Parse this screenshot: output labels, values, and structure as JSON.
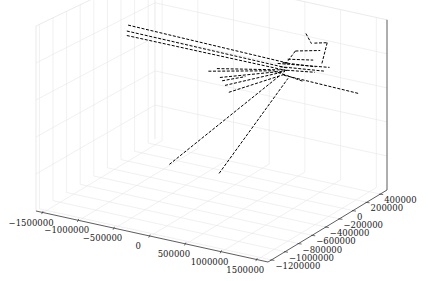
{
  "chart_data": {
    "type": "line3d",
    "title": "",
    "xlabel": "",
    "ylabel": "",
    "zlabel": "",
    "grid": true,
    "line_style": "dashed",
    "line_color": "#000000",
    "pane_color": "#ffffff",
    "grid_color": "#e6e6e6",
    "xlim": [
      -1600000,
      1650000
    ],
    "ylim": [
      -1250000,
      500000
    ],
    "zlim": [
      0,
      1
    ],
    "x_ticks": [
      -1500000,
      -1000000,
      -500000,
      0,
      500000,
      1000000,
      1500000
    ],
    "x_tick_labels": [
      "−1500000",
      "−1000000",
      "−500000",
      "0",
      "500000",
      "1000000",
      "1500000"
    ],
    "y_ticks": [
      -1200000,
      -1000000,
      -800000,
      -600000,
      -400000,
      -200000,
      0,
      200000,
      400000
    ],
    "y_tick_labels": [
      "−1200000",
      "−1000000",
      "−800000",
      "−600000",
      "−400000",
      "−200000",
      "0",
      "200000",
      "400000"
    ],
    "z_ticks": [],
    "series": [
      {
        "name": "path-1",
        "points": [
          [
            -1500000,
            0,
            0.78
          ],
          [
            600000,
            150000,
            0.72
          ]
        ]
      },
      {
        "name": "path-2",
        "points": [
          [
            -1500000,
            -20000,
            0.75
          ],
          [
            620000,
            120000,
            0.7
          ]
        ]
      },
      {
        "name": "path-3",
        "points": [
          [
            -1480000,
            -40000,
            0.73
          ],
          [
            640000,
            100000,
            0.69
          ]
        ]
      },
      {
        "name": "path-4",
        "points": [
          [
            -200000,
            -60000,
            0.66
          ],
          [
            600000,
            60000,
            0.7
          ]
        ]
      },
      {
        "name": "path-5",
        "points": [
          [
            -100000,
            -120000,
            0.63
          ],
          [
            650000,
            50000,
            0.7
          ]
        ]
      },
      {
        "name": "path-6",
        "points": [
          [
            0,
            -150000,
            0.6
          ],
          [
            660000,
            40000,
            0.7
          ]
        ]
      },
      {
        "name": "path-7",
        "points": [
          [
            100000,
            -200000,
            0.58
          ],
          [
            680000,
            30000,
            0.69
          ]
        ]
      },
      {
        "name": "path-8",
        "points": [
          [
            -350000,
            -600000,
            0.22
          ],
          [
            620000,
            0,
            0.68
          ]
        ]
      },
      {
        "name": "path-9",
        "points": [
          [
            250000,
            -500000,
            0.2
          ],
          [
            720000,
            20000,
            0.67
          ]
        ]
      },
      {
        "name": "path-10",
        "points": [
          [
            650000,
            30000,
            0.68
          ],
          [
            1550000,
            200000,
            0.62
          ]
        ]
      },
      {
        "name": "path-11",
        "points": [
          [
            500000,
            100000,
            0.72
          ],
          [
            1150000,
            180000,
            0.74
          ]
        ]
      },
      {
        "name": "path-12",
        "points": [
          [
            550000,
            80000,
            0.71
          ],
          [
            1100000,
            150000,
            0.72
          ]
        ]
      },
      {
        "name": "path-13",
        "points": [
          [
            600000,
            60000,
            0.7
          ],
          [
            1000000,
            120000,
            0.71
          ]
        ]
      },
      {
        "name": "path-14",
        "points": [
          [
            700000,
            150000,
            0.8
          ],
          [
            1000000,
            200000,
            0.82
          ]
        ]
      },
      {
        "name": "path-15",
        "points": [
          [
            900000,
            220000,
            0.85
          ],
          [
            1050000,
            250000,
            0.86
          ]
        ]
      },
      {
        "name": "path-16",
        "points": [
          [
            1050000,
            250000,
            0.86
          ],
          [
            1020000,
            200000,
            0.74
          ]
        ]
      },
      {
        "name": "path-17",
        "points": [
          [
            800000,
            200000,
            0.9
          ],
          [
            850000,
            230000,
            0.84
          ]
        ]
      },
      {
        "name": "path-18",
        "points": [
          [
            700000,
            150000,
            0.8
          ],
          [
            600000,
            100000,
            0.72
          ]
        ]
      },
      {
        "name": "path-19",
        "points": [
          [
            650000,
            90000,
            0.76
          ],
          [
            950000,
            150000,
            0.77
          ]
        ]
      },
      {
        "name": "path-20",
        "points": [
          [
            600000,
            70000,
            0.74
          ],
          [
            1000000,
            130000,
            0.74
          ]
        ]
      },
      {
        "name": "path-21",
        "points": [
          [
            500000,
            40000,
            0.69
          ],
          [
            900000,
            60000,
            0.66
          ]
        ]
      },
      {
        "name": "path-22",
        "points": [
          [
            -300000,
            -80000,
            0.64
          ],
          [
            500000,
            40000,
            0.69
          ]
        ]
      },
      {
        "name": "path-23",
        "points": [
          [
            -50000,
            -140000,
            0.62
          ],
          [
            200000,
            -60000,
            0.65
          ]
        ]
      }
    ]
  }
}
